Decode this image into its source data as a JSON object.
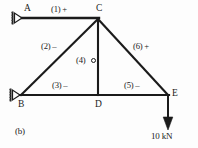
{
  "figure": {
    "caption": "(b)",
    "load_label": "10 kN"
  },
  "nodes": [
    {
      "id": "A",
      "label": "A",
      "x": 22,
      "y": 18
    },
    {
      "id": "C",
      "label": "C",
      "x": 98,
      "y": 18
    },
    {
      "id": "B",
      "label": "B",
      "x": 20,
      "y": 95
    },
    {
      "id": "D",
      "label": "D",
      "x": 98,
      "y": 95
    },
    {
      "id": "E",
      "label": "E",
      "x": 168,
      "y": 95
    }
  ],
  "members": [
    {
      "id": "1",
      "label": "(1) +",
      "from": "A",
      "to": "C",
      "sign": "+"
    },
    {
      "id": "2",
      "label": "(2) –",
      "from": "B",
      "to": "C",
      "sign": "-"
    },
    {
      "id": "3",
      "label": "(3) –",
      "from": "B",
      "to": "D",
      "sign": "-"
    },
    {
      "id": "4",
      "label": "(4)",
      "from": "C",
      "to": "D",
      "sign": "0"
    },
    {
      "id": "5",
      "label": "(5) –",
      "from": "D",
      "to": "E",
      "sign": "-"
    },
    {
      "id": "6",
      "label": "(6) +",
      "from": "C",
      "to": "E",
      "sign": "+"
    }
  ],
  "supports": [
    {
      "at": "A",
      "type": "roller-pin-left"
    },
    {
      "at": "B",
      "type": "roller-pin-left"
    }
  ],
  "load": {
    "at": "E",
    "direction": "down",
    "magnitude": "10 kN"
  },
  "colors": {
    "line": "#1b1b1b",
    "text": "#1b1b1b",
    "background": "#fdfdfd"
  }
}
